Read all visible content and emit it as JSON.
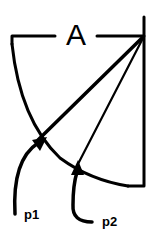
{
  "diagram": {
    "type": "geometry-arc-figure",
    "labels": {
      "angle": "A",
      "point1": "p1",
      "point2": "p2"
    },
    "colors": {
      "stroke": "#000000",
      "background": "#ffffff"
    },
    "elements": [
      {
        "id": "top-line",
        "kind": "horizontal-line-with-label-gap",
        "label": "A"
      },
      {
        "id": "right-vertical",
        "kind": "vertical-line"
      },
      {
        "id": "arc",
        "kind": "curved-arc"
      },
      {
        "id": "ray-1",
        "kind": "line-from-top-right",
        "intersects": "p1"
      },
      {
        "id": "ray-2",
        "kind": "line-from-top-right",
        "intersects": "p2"
      },
      {
        "id": "arrow-p1",
        "kind": "curved-arrow",
        "points_to": "p1"
      },
      {
        "id": "arrow-p2",
        "kind": "curved-arrow",
        "points_to": "p2"
      }
    ]
  }
}
